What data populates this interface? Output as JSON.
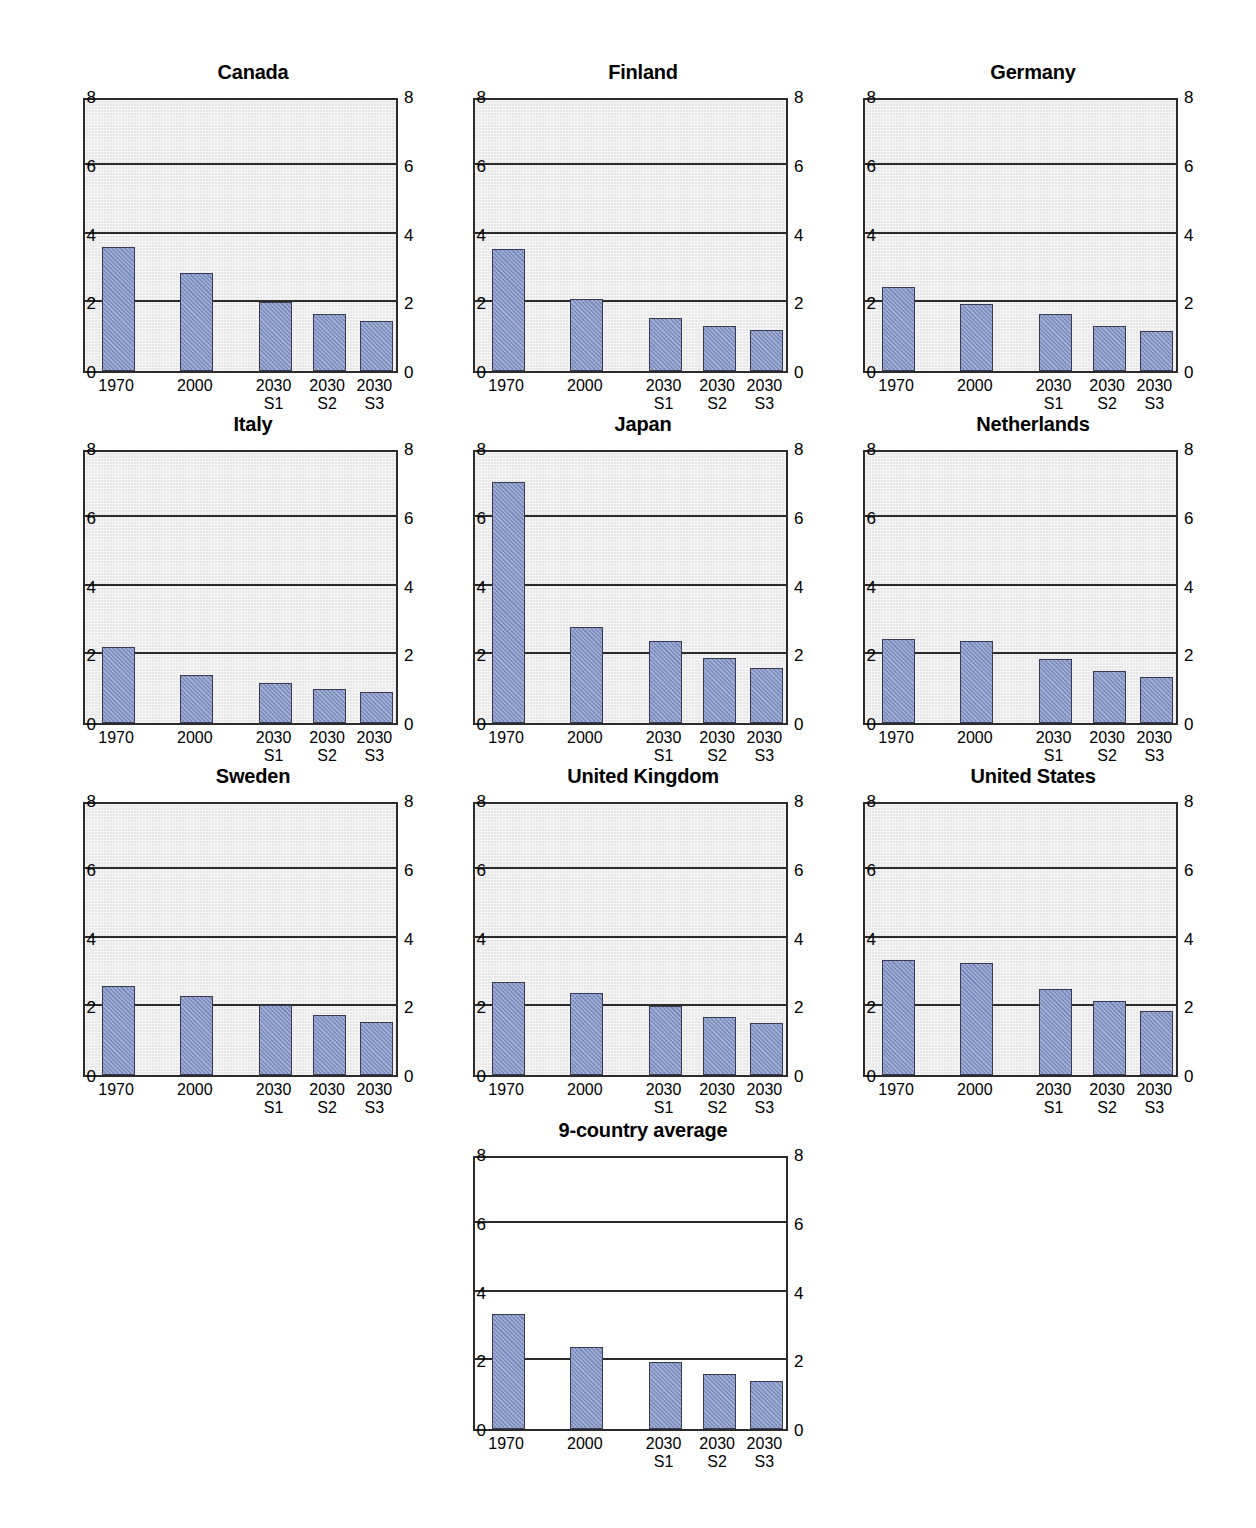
{
  "chart_data": {
    "type": "bar",
    "title": "",
    "xlabel": "",
    "ylabel": "",
    "ylim": [
      0,
      8
    ],
    "yticks": [
      0,
      2,
      4,
      6,
      8
    ],
    "grid": true,
    "legend": "none",
    "categories": [
      "1970",
      "2000",
      "2030 S1",
      "2030 S2",
      "2030 S3"
    ],
    "category_labels": [
      {
        "line1": "1970",
        "line2": ""
      },
      {
        "line1": "2000",
        "line2": ""
      },
      {
        "line1": "2030",
        "line2": "S1"
      },
      {
        "line1": "2030",
        "line2": "S2"
      },
      {
        "line1": "2030",
        "line2": "S3"
      }
    ],
    "panels": [
      {
        "title": "Canada",
        "values": [
          3.6,
          2.85,
          2.0,
          1.65,
          1.45
        ],
        "background": "#e7e7e7"
      },
      {
        "title": "Finland",
        "values": [
          3.55,
          2.1,
          1.55,
          1.3,
          1.2
        ],
        "background": "#e7e7e7"
      },
      {
        "title": "Germany",
        "values": [
          2.45,
          1.95,
          1.65,
          1.3,
          1.15
        ],
        "background": "#e7e7e7"
      },
      {
        "title": "Italy",
        "values": [
          2.2,
          1.4,
          1.15,
          1.0,
          0.9
        ],
        "background": "#e7e7e7"
      },
      {
        "title": "Japan",
        "values": [
          7.0,
          2.8,
          2.4,
          1.9,
          1.6
        ],
        "background": "#e7e7e7"
      },
      {
        "title": "Netherlands",
        "values": [
          2.45,
          2.4,
          1.85,
          1.5,
          1.35
        ],
        "background": "#e7e7e7"
      },
      {
        "title": "Sweden",
        "values": [
          2.6,
          2.3,
          2.05,
          1.75,
          1.55
        ],
        "background": "#e7e7e7"
      },
      {
        "title": "United Kingdom",
        "values": [
          2.7,
          2.4,
          2.0,
          1.7,
          1.5
        ],
        "background": "#e7e7e7"
      },
      {
        "title": "United States",
        "values": [
          3.35,
          3.25,
          2.5,
          2.15,
          1.85
        ],
        "background": "#e7e7e7"
      },
      {
        "title": "9-country average",
        "values": [
          3.35,
          2.4,
          1.95,
          1.6,
          1.4
        ],
        "background": "#ffffff"
      }
    ],
    "series_color": "#7e90c6"
  },
  "layout": {
    "columns": 3,
    "rows": 4,
    "panel_positions": [
      {
        "left": 58,
        "top": 60
      },
      {
        "left": 448,
        "top": 60
      },
      {
        "left": 838,
        "top": 60
      },
      {
        "left": 58,
        "top": 412
      },
      {
        "left": 448,
        "top": 412
      },
      {
        "left": 838,
        "top": 412
      },
      {
        "left": 58,
        "top": 764
      },
      {
        "left": 448,
        "top": 764
      },
      {
        "left": 838,
        "top": 764
      },
      {
        "left": 448,
        "top": 1118
      }
    ]
  }
}
